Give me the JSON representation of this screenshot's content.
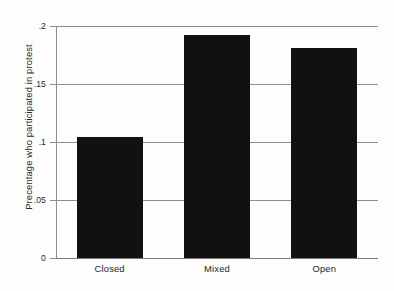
{
  "chart_data": {
    "type": "bar",
    "title": "",
    "subtitle": "",
    "xlabel": "",
    "ylabel": "Precentage who participated in protest",
    "categories": [
      "Closed",
      "Mixed",
      "Open"
    ],
    "values": [
      0.104,
      0.192,
      0.181
    ],
    "series": [
      {
        "name": "Percentage who participated in protest",
        "values": [
          0.104,
          0.192,
          0.181
        ]
      }
    ],
    "ylim": [
      0,
      0.2
    ],
    "xlim": [
      0,
      3
    ],
    "yticks": [
      0,
      0.05,
      0.1,
      0.15,
      0.2
    ],
    "ytick_labels": [
      "0",
      ".05",
      ".1",
      ".15",
      ".2"
    ],
    "xtick_labels": [
      "Closed",
      "Mixed",
      "Open"
    ],
    "grid": true,
    "grid_axis": "y",
    "legend": false,
    "legend_position": "none",
    "bar_color": "#111111",
    "gridline_color": "#8e8e8e",
    "axis_color": "#8e8e8e",
    "background_color": "#fdfdfc",
    "annotations": []
  },
  "axis": {
    "y_title": "Precentage who participated in protest",
    "ticks": [
      {
        "label": ".2",
        "value": 0.2
      },
      {
        "label": ".15",
        "value": 0.15
      },
      {
        "label": ".1",
        "value": 0.1
      },
      {
        "label": ".05",
        "value": 0.05
      },
      {
        "label": "0",
        "value": 0
      }
    ]
  },
  "bars": [
    {
      "label": "Closed",
      "value": 0.104
    },
    {
      "label": "Mixed",
      "value": 0.192
    },
    {
      "label": "Open",
      "value": 0.181
    }
  ]
}
